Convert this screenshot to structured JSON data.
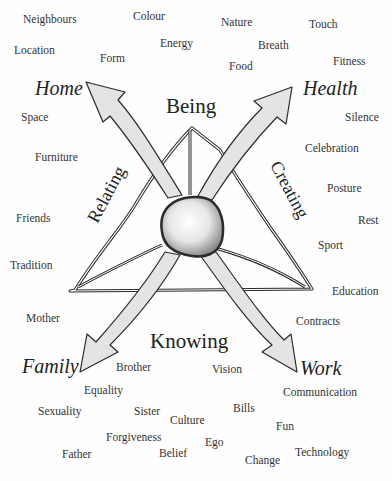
{
  "diagram": {
    "center": {
      "label": "",
      "shape": "sphere"
    },
    "modes": {
      "top": "Being",
      "left": "Relating",
      "right": "Creating",
      "bottom": "Knowing"
    },
    "areas": {
      "top_left": "Home",
      "top_right": "Health",
      "bottom_left": "Family",
      "bottom_right": "Work"
    },
    "words": {
      "neighbours": "Neighbours",
      "colour": "Colour",
      "nature": "Nature",
      "touch": "Touch",
      "location": "Location",
      "energy": "Energy",
      "breath": "Breath",
      "form": "Form",
      "food": "Food",
      "fitness": "Fitness",
      "space": "Space",
      "silence": "Silence",
      "furniture": "Furniture",
      "celebration": "Celebration",
      "posture": "Posture",
      "friends": "Friends",
      "rest": "Rest",
      "sport": "Sport",
      "tradition": "Tradition",
      "education": "Education",
      "mother": "Mother",
      "contracts": "Contracts",
      "brother": "Brother",
      "vision": "Vision",
      "equality": "Equality",
      "communication": "Communication",
      "sexuality": "Sexuality",
      "sister": "Sister",
      "culture": "Culture",
      "bills": "Bills",
      "fun": "Fun",
      "forgiveness": "Forgiveness",
      "ego": "Ego",
      "father": "Father",
      "belief": "Belief",
      "change": "Change",
      "technology": "Technology"
    },
    "colors": {
      "arrow_fill": "#e4e4e4",
      "outline": "#2b2b2b",
      "text": "#2a2a2a"
    }
  }
}
